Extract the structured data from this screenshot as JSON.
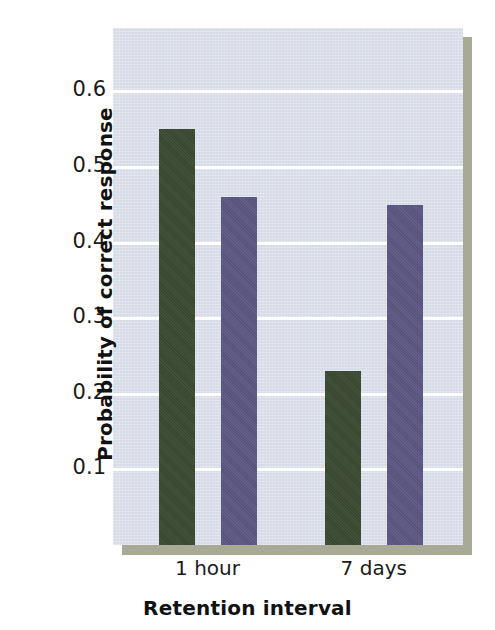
{
  "chart_data": {
    "type": "bar",
    "title": "",
    "subtitle": "",
    "xlabel": "Retention interval",
    "ylabel": "Probability of correct response",
    "categories": [
      "1 hour",
      "7 days"
    ],
    "series": [
      {
        "name": "green-series",
        "color": "#3b4a31",
        "values": [
          0.55,
          0.23
        ]
      },
      {
        "name": "purple-series",
        "color": "#5c5682",
        "values": [
          0.46,
          0.45
        ]
      }
    ],
    "ylim": [
      0,
      0.684
    ],
    "yticks": [
      0.1,
      0.2,
      0.3,
      0.4,
      0.5,
      0.6
    ],
    "ytick_labels": [
      "0.1",
      "0.2",
      "0.3",
      "0.4",
      "0.5",
      "0.6"
    ],
    "xtick_labels": [
      "1 hour",
      "7 days"
    ],
    "grid": "horizontal",
    "legend": "none",
    "plot_background": "#d7dae7",
    "gridline_color": "#ffffff",
    "figure_background": "#ffffff"
  },
  "axes": {
    "y": {
      "ticks": [
        {
          "label": "0.6",
          "value": 0.6
        },
        {
          "label": "0.5",
          "value": 0.5
        },
        {
          "label": "0.4",
          "value": 0.4
        },
        {
          "label": "0.3",
          "value": 0.3
        },
        {
          "label": "0.2",
          "value": 0.2
        },
        {
          "label": "0.1",
          "value": 0.1
        }
      ],
      "title": "Probability of correct response"
    },
    "x": {
      "ticks": [
        {
          "label": "1 hour"
        },
        {
          "label": "7 days"
        }
      ],
      "title": "Retention interval"
    }
  },
  "bars": [
    {
      "name": "bar-1-hour-green",
      "group": "1 hour",
      "series": "green-series",
      "value": 0.55
    },
    {
      "name": "bar-1-hour-purple",
      "group": "1 hour",
      "series": "purple-series",
      "value": 0.46
    },
    {
      "name": "bar-7-days-green",
      "group": "7 days",
      "series": "green-series",
      "value": 0.23
    },
    {
      "name": "bar-7-days-purple",
      "group": "7 days",
      "series": "purple-series",
      "value": 0.45
    }
  ]
}
